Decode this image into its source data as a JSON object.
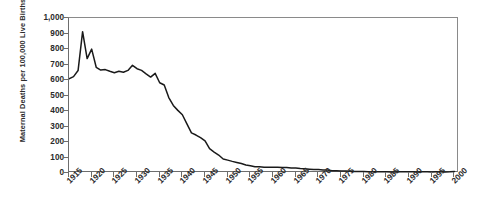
{
  "chart_data": {
    "type": "line",
    "title": "",
    "xlabel": "",
    "ylabel": "Maternal Deaths per 100,000 Live Births",
    "xlim": [
      1915,
      2001
    ],
    "ylim": [
      0,
      1000
    ],
    "grid": false,
    "legend": "none",
    "y_ticks": [
      "0",
      "100",
      "200",
      "300",
      "400",
      "500",
      "600",
      "700",
      "800",
      "900",
      "1,000"
    ],
    "y_tick_values": [
      0,
      100,
      200,
      300,
      400,
      500,
      600,
      700,
      800,
      900,
      1000
    ],
    "x_ticks": [
      "1915",
      "1920",
      "1925",
      "1930",
      "1935",
      "1940",
      "1945",
      "1950",
      "1955",
      "1960",
      "1965",
      "1970",
      "1975",
      "1980",
      "1985",
      "1990",
      "1995",
      "2000"
    ],
    "x_tick_values": [
      1915,
      1920,
      1925,
      1930,
      1935,
      1940,
      1945,
      1950,
      1955,
      1960,
      1965,
      1970,
      1975,
      1980,
      1985,
      1990,
      1995,
      2000
    ],
    "line_color": "#1a1a1a",
    "x": [
      1915,
      1916,
      1917,
      1918,
      1919,
      1920,
      1921,
      1922,
      1923,
      1924,
      1925,
      1926,
      1927,
      1928,
      1929,
      1930,
      1931,
      1932,
      1933,
      1934,
      1935,
      1936,
      1937,
      1938,
      1939,
      1940,
      1941,
      1942,
      1943,
      1944,
      1945,
      1946,
      1947,
      1948,
      1949,
      1950,
      1951,
      1952,
      1953,
      1954,
      1955,
      1956,
      1957,
      1958,
      1959,
      1960,
      1961,
      1962,
      1963,
      1964,
      1965,
      1966,
      1967,
      1968,
      1969,
      1970,
      1971,
      1972,
      1973,
      1974,
      1975,
      1976,
      1977,
      1978,
      1979,
      1980,
      1981,
      1982,
      1983,
      1984,
      1985,
      1986,
      1987,
      1988,
      1989,
      1990,
      1991,
      1992,
      1993,
      1994,
      1995,
      1996,
      1997,
      1998,
      1999,
      2000
    ],
    "values": [
      608,
      622,
      661,
      912,
      738,
      799,
      682,
      664,
      667,
      656,
      647,
      656,
      650,
      662,
      695,
      673,
      662,
      640,
      619,
      643,
      582,
      568,
      487,
      436,
      404,
      376,
      317,
      259,
      245,
      228,
      207,
      157,
      135,
      116,
      90,
      83,
      75,
      68,
      61,
      52,
      47,
      41,
      41,
      37,
      37,
      37,
      37,
      35,
      36,
      33,
      32,
      29,
      28,
      25,
      22,
      22,
      19,
      19,
      15,
      15,
      13,
      13,
      11,
      10,
      10,
      9,
      8,
      8,
      8,
      8,
      8,
      7,
      7,
      8,
      8,
      8,
      8,
      7,
      8,
      8,
      7,
      8,
      8,
      7,
      8,
      10
    ],
    "peaks": [
      {
        "year": 1918,
        "value": 912,
        "note": "influenza pandemic peak"
      },
      {
        "year": 1920,
        "value": 799,
        "note": "secondary peak"
      }
    ]
  }
}
